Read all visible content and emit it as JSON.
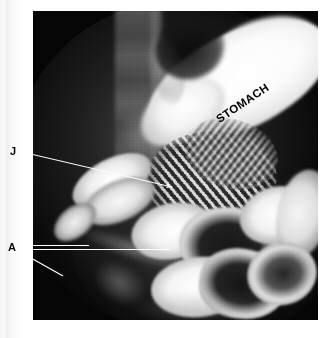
{
  "figure": {
    "kind": "radiograph",
    "modality": "barium-contrast-upper-gi-series",
    "plate_background_color": "#050505",
    "page_background_color": "#fdfdfd"
  },
  "labels": {
    "stomach": "STOMACH",
    "jejunum": "J",
    "anastomosis": "A"
  },
  "annotation_lines": {
    "color": "#ffffff",
    "leader_j": {
      "from_x": 22,
      "from_y": 152,
      "to_x": 176,
      "to_y": 188,
      "has_arrowhead": true
    },
    "leader_a_upper": {
      "from_x": 23,
      "from_y": 246,
      "to_x": 89,
      "to_y": 246,
      "has_arrowhead": false
    },
    "leader_a_middle": {
      "from_x": 23,
      "from_y": 250,
      "to_x": 170,
      "to_y": 250,
      "has_arrowhead": false
    },
    "leader_a_lower": {
      "from_x": 23,
      "from_y": 254,
      "to_x": 63,
      "to_y": 276,
      "has_arrowhead": false
    }
  },
  "anatomy_regions": [
    {
      "name": "stomach",
      "description": "large barium-filled stomach running upper-right to lower-left"
    },
    {
      "name": "gastric-gas-bubble",
      "description": "dark gas notch at the cardia"
    },
    {
      "name": "spine",
      "description": "faint vertebral column, upper left of field"
    },
    {
      "name": "jejunum",
      "description": "feathery jejunal loops in the mid abdomen"
    },
    {
      "name": "small-bowel-loops",
      "description": "opacified small bowel loops filling the lower abdomen"
    }
  ]
}
